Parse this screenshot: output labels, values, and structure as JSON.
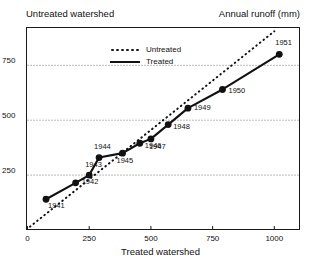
{
  "header": {
    "left_label": "Untreated watershed",
    "right_label": "Annual runoff (mm)"
  },
  "axis_titles": {
    "x": "Treated watershed"
  },
  "legend": {
    "position": "top-center",
    "items": [
      {
        "label": "Untreated",
        "style": "dotted",
        "color": "#111111"
      },
      {
        "label": "Treated",
        "style": "solid",
        "color": "#111111"
      }
    ]
  },
  "chart_data": {
    "type": "line",
    "title": "",
    "subtitle": "",
    "xlabel": "Treated watershed",
    "ylabel": "Annual runoff (mm)",
    "xlim": [
      0,
      1100
    ],
    "ylim": [
      0,
      920
    ],
    "xticks": [
      0,
      250,
      500,
      750,
      1000
    ],
    "xticklabels": [
      "0",
      "250",
      "500",
      "750",
      "1000"
    ],
    "yticks": [
      250,
      500,
      750
    ],
    "yticklabels": [
      "250",
      "500",
      "750"
    ],
    "grid": "horizontal-dotted",
    "legend_entries": [
      "Untreated",
      "Treated"
    ],
    "series": [
      {
        "name": "Treated",
        "style": "solid",
        "marker": "filled-circle",
        "color": "#111111",
        "points": [
          {
            "label": "1941",
            "x": 75,
            "y": 140
          },
          {
            "label": "1942",
            "x": 195,
            "y": 215
          },
          {
            "label": "1943",
            "x": 250,
            "y": 250
          },
          {
            "label": "1944",
            "x": 290,
            "y": 330
          },
          {
            "label": "1945",
            "x": 385,
            "y": 350
          },
          {
            "label": "1946",
            "x": 455,
            "y": 395
          },
          {
            "label": "1947",
            "x": 500,
            "y": 415
          },
          {
            "label": "1948",
            "x": 570,
            "y": 480
          },
          {
            "label": "1949",
            "x": 650,
            "y": 555
          },
          {
            "label": "1950",
            "x": 790,
            "y": 640
          },
          {
            "label": "1951",
            "x": 1020,
            "y": 800
          }
        ]
      },
      {
        "name": "Untreated",
        "style": "dotted",
        "marker": "none",
        "color": "#111111",
        "points": [
          {
            "x": 10,
            "y": 15
          },
          {
            "x": 1000,
            "y": 905
          }
        ]
      }
    ]
  }
}
